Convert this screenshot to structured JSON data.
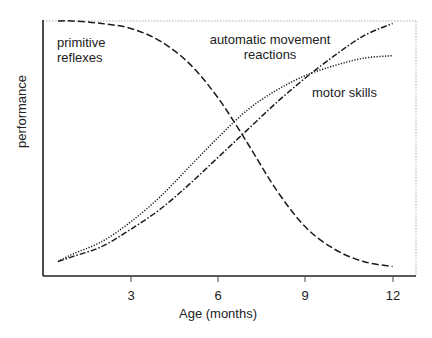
{
  "chart_data": {
    "type": "line",
    "title": "",
    "xlabel": "Age (months)",
    "ylabel": "performance",
    "xlim": [
      0,
      12.8
    ],
    "ylim": [
      0,
      1
    ],
    "xticks": [
      3,
      6,
      9,
      12
    ],
    "yticks": [],
    "grid": false,
    "legend": "inline labels",
    "x": [
      0.5,
      1,
      2,
      3,
      4,
      5,
      6,
      7,
      8,
      9,
      10,
      11,
      12
    ],
    "series": [
      {
        "name": "primitive reflexes",
        "style": "dashed",
        "values": [
          1.0,
          1.0,
          0.99,
          0.97,
          0.92,
          0.83,
          0.69,
          0.51,
          0.32,
          0.17,
          0.08,
          0.03,
          0.01
        ]
      },
      {
        "name": "automatic movement reactions",
        "style": "dotted",
        "values": [
          0.03,
          0.06,
          0.11,
          0.19,
          0.29,
          0.41,
          0.53,
          0.64,
          0.72,
          0.78,
          0.82,
          0.85,
          0.86
        ]
      },
      {
        "name": "motor skills",
        "style": "dash-dot",
        "values": [
          0.03,
          0.05,
          0.09,
          0.16,
          0.24,
          0.34,
          0.45,
          0.56,
          0.67,
          0.77,
          0.86,
          0.94,
          0.99
        ]
      }
    ],
    "annotations": [
      "primitive reflexes",
      "automatic movement reactions",
      "motor skills"
    ]
  },
  "labels": {
    "primitive_1": "primitive",
    "primitive_2": "reflexes",
    "automatic_1": "automatic movement",
    "automatic_2": "reactions",
    "motor": "motor skills",
    "xlabel": "Age (months)",
    "ylabel": "performance",
    "ticks": [
      "3",
      "6",
      "9",
      "12"
    ]
  }
}
